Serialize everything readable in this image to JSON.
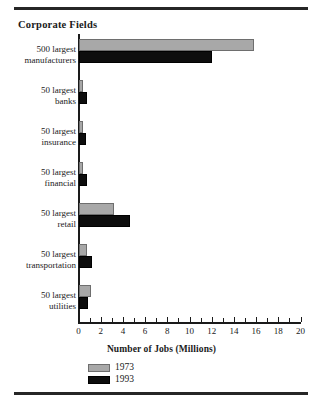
{
  "chart_data": {
    "type": "bar",
    "orientation": "horizontal",
    "title": "Corporate Fields",
    "xlabel": "Number of Jobs (Millions)",
    "ylabel": "",
    "xlim": [
      0,
      20
    ],
    "xticks": [
      0,
      2,
      4,
      6,
      8,
      10,
      12,
      14,
      16,
      18,
      20
    ],
    "xtick_labels": [
      "0",
      "2",
      "4",
      "6",
      "8",
      "10",
      "12",
      "14",
      "16",
      "18",
      "20"
    ],
    "minor_tick_step": 1,
    "grid": false,
    "legend_position": "bottom-left",
    "categories": [
      "500 largest\nmanufacturers",
      "50 largest\nbanks",
      "50 largest\ninsurance",
      "50 largest\nfinancial",
      "50 largest\nretail",
      "50 largest\ntransportation",
      "50 largest\nutilities"
    ],
    "series": [
      {
        "name": "1973",
        "color": "#a8a8a8",
        "values": [
          15.8,
          0.4,
          0.4,
          0.4,
          3.2,
          0.8,
          1.1
        ]
      },
      {
        "name": "1993",
        "color": "#0d0d0d",
        "values": [
          12.0,
          0.8,
          0.7,
          0.8,
          4.6,
          1.2,
          0.9
        ]
      }
    ]
  },
  "legend": {
    "items": [
      {
        "label": "1973",
        "color": "#a8a8a8"
      },
      {
        "label": "1993",
        "color": "#0d0d0d"
      }
    ]
  },
  "colors": {
    "series_1973": "#a8a8a8",
    "series_1993": "#0d0d0d",
    "rule": "#262626",
    "axis": "#1a1a1a",
    "background": "#ffffff"
  }
}
